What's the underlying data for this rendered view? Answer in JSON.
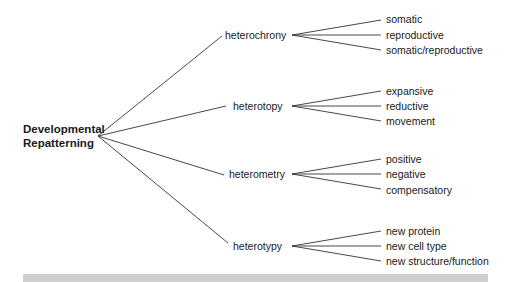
{
  "root": {
    "line1": "Developmental",
    "line2": "Repatterning"
  },
  "branches": [
    {
      "label": "heterochrony",
      "children": [
        "somatic",
        "reproductive",
        "somatic/reproductive"
      ]
    },
    {
      "label": "heterotopy",
      "children": [
        "expansive",
        "reductive",
        "movement"
      ]
    },
    {
      "label": "heterometry",
      "children": [
        "positive",
        "negative",
        "compensatory"
      ]
    },
    {
      "label": "heterotypy",
      "children": [
        "new protein",
        "new cell type",
        "new structure/function"
      ]
    }
  ],
  "colors": {
    "line": "#333333",
    "bar": "#cfcfcf"
  }
}
